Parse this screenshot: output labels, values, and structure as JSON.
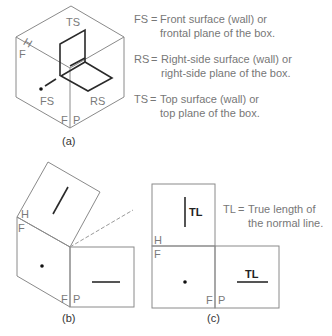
{
  "figure_a": {
    "caption": "(a)",
    "labels": {
      "ts": "TS",
      "fs": "FS",
      "rs": "RS",
      "h": "H",
      "f": "F",
      "fp_f": "F",
      "fp_p": "P"
    },
    "legend": [
      {
        "key": "FS",
        "eq": "=",
        "line1": "Front surface (wall) or",
        "line2": "frontal plane of the box."
      },
      {
        "key": "RS",
        "eq": "=",
        "line1": "Right-side surface (wall) or",
        "line2": "right-side plane of the box."
      },
      {
        "key": "TS",
        "eq": "=",
        "line1": "Top surface (wall) or",
        "line2": "top plane of the box."
      }
    ]
  },
  "figure_b": {
    "caption": "(b)",
    "labels": {
      "h": "H",
      "f": "F",
      "fp_f": "F",
      "fp_p": "P"
    }
  },
  "figure_c": {
    "caption": "(c)",
    "labels": {
      "h": "H",
      "f": "F",
      "fp_f": "F",
      "fp_p": "P",
      "tl_top": "TL",
      "tl_right": "TL"
    },
    "note": {
      "key": "TL",
      "eq": "=",
      "line1": "True length of",
      "line2": "the normal line."
    }
  },
  "colors": {
    "outline": "#8a8a8a",
    "heavy": "#2a2a2a",
    "label": "#7a7a7a"
  }
}
